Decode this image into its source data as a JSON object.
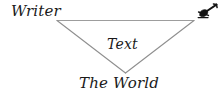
{
  "diagram": {
    "type": "triangle-relationship-diagram",
    "style": "hand-drawn",
    "line_color": "#9a9a9a",
    "text_color": "#1a1a1a",
    "background_color": "#ffffff",
    "vertices": [
      {
        "id": "writer",
        "label": "Writer",
        "position": "top-left",
        "x": 57,
        "y": 20
      },
      {
        "id": "reader",
        "label": "",
        "icon": "quill-pen-icon",
        "position": "top-right",
        "x": 195,
        "y": 20
      },
      {
        "id": "world",
        "label": "The World",
        "position": "bottom",
        "x": 125,
        "y": 73
      }
    ],
    "center": {
      "id": "text",
      "label": "Text"
    },
    "edges": [
      {
        "from": "writer",
        "to": "reader"
      },
      {
        "from": "writer",
        "to": "world"
      },
      {
        "from": "reader",
        "to": "world"
      }
    ]
  },
  "labels": {
    "writer": "Writer",
    "text": "Text",
    "the_world": "The World"
  },
  "icons": {
    "reader": "quill-pen-icon"
  }
}
